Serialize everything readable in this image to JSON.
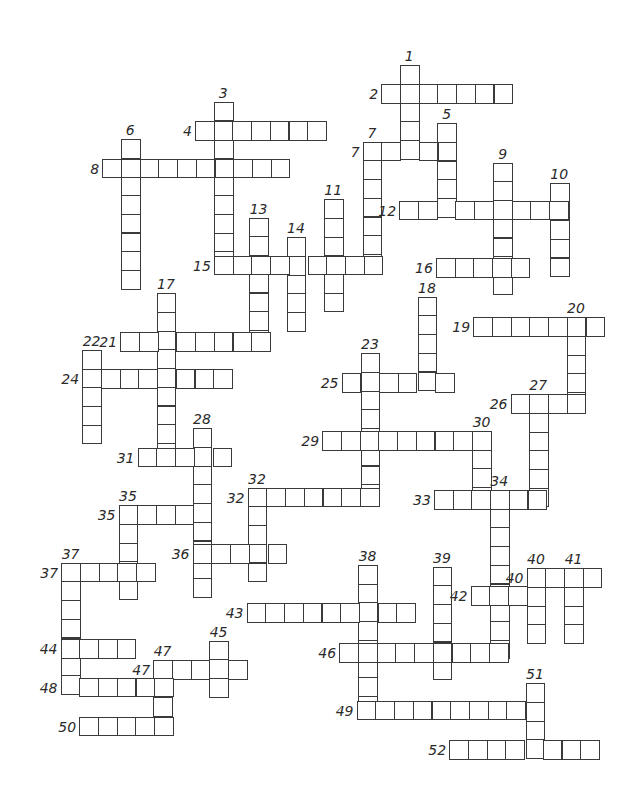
{
  "puzzle": {
    "type": "crossword",
    "cell_size": 18.7,
    "line_color": "#3a3a3a",
    "background": "#ffffff",
    "words": [
      {
        "num": "1",
        "dir": "down",
        "x": 400,
        "y": 65.3,
        "len": 5
      },
      {
        "num": "2",
        "dir": "across",
        "x": 381.3,
        "y": 84,
        "len": 7
      },
      {
        "num": "3",
        "dir": "down",
        "x": 214,
        "y": 101.7,
        "len": 9
      },
      {
        "num": "4",
        "dir": "across",
        "x": 195,
        "y": 121,
        "len": 7
      },
      {
        "num": "5",
        "dir": "down",
        "x": 437.3,
        "y": 123.3,
        "len": 5
      },
      {
        "num": "6",
        "dir": "down",
        "x": 121,
        "y": 139,
        "len": 8
      },
      {
        "num": "7",
        "dir": "across",
        "x": 362.7,
        "y": 141.7,
        "len": 5
      },
      {
        "num": "7",
        "dir": "down",
        "x": 362.7,
        "y": 141.7,
        "len": 7
      },
      {
        "num": "8",
        "dir": "across",
        "x": 102.3,
        "y": 158.7,
        "len": 10
      },
      {
        "num": "9",
        "dir": "down",
        "x": 493.3,
        "y": 162.7,
        "len": 7
      },
      {
        "num": "10",
        "dir": "down",
        "x": 550,
        "y": 182.7,
        "len": 5
      },
      {
        "num": "11",
        "dir": "down",
        "x": 324,
        "y": 199.3,
        "len": 6
      },
      {
        "num": "12",
        "dir": "across",
        "x": 399.3,
        "y": 200.7,
        "len": 9
      },
      {
        "num": "13",
        "dir": "down",
        "x": 249.3,
        "y": 217.7,
        "len": 7
      },
      {
        "num": "14",
        "dir": "down",
        "x": 286.7,
        "y": 237.3,
        "len": 5
      },
      {
        "num": "15",
        "dir": "across",
        "x": 214,
        "y": 255.7,
        "len": 9
      },
      {
        "num": "16",
        "dir": "across",
        "x": 436,
        "y": 258.3,
        "len": 5
      },
      {
        "num": "17",
        "dir": "down",
        "x": 156.7,
        "y": 293.3,
        "len": 9
      },
      {
        "num": "18",
        "dir": "down",
        "x": 417.7,
        "y": 296.7,
        "len": 5
      },
      {
        "num": "19",
        "dir": "across",
        "x": 473.3,
        "y": 317.3,
        "len": 7
      },
      {
        "num": "20",
        "dir": "down",
        "x": 566.7,
        "y": 317.3,
        "len": 5
      },
      {
        "num": "21",
        "dir": "across",
        "x": 120.3,
        "y": 332.3,
        "len": 8
      },
      {
        "num": "22",
        "dir": "down",
        "x": 82.3,
        "y": 350,
        "len": 5
      },
      {
        "num": "23",
        "dir": "down",
        "x": 360.7,
        "y": 353.3,
        "len": 8
      },
      {
        "num": "24",
        "dir": "across",
        "x": 82.3,
        "y": 369.3,
        "len": 8
      },
      {
        "num": "25",
        "dir": "across",
        "x": 341.7,
        "y": 373.3,
        "len": 6
      },
      {
        "num": "26",
        "dir": "across",
        "x": 510.7,
        "y": 394.3,
        "len": 4
      },
      {
        "num": "27",
        "dir": "down",
        "x": 529,
        "y": 394.3,
        "len": 6
      },
      {
        "num": "28",
        "dir": "down",
        "x": 192.7,
        "y": 428.3,
        "len": 9
      },
      {
        "num": "29",
        "dir": "across",
        "x": 322.3,
        "y": 431,
        "len": 9
      },
      {
        "num": "30",
        "dir": "down",
        "x": 472.3,
        "y": 431,
        "len": 4
      },
      {
        "num": "31",
        "dir": "across",
        "x": 137.7,
        "y": 447.7,
        "len": 5
      },
      {
        "num": "32",
        "dir": "across",
        "x": 247.7,
        "y": 487.7,
        "len": 7
      },
      {
        "num": "32",
        "dir": "down",
        "x": 247.7,
        "y": 487.7,
        "len": 5
      },
      {
        "num": "33",
        "dir": "across",
        "x": 434,
        "y": 490,
        "len": 6
      },
      {
        "num": "34",
        "dir": "down",
        "x": 490,
        "y": 490,
        "len": 9
      },
      {
        "num": "35",
        "dir": "across",
        "x": 118.7,
        "y": 505.3,
        "len": 5
      },
      {
        "num": "35",
        "dir": "down",
        "x": 118.7,
        "y": 505.3,
        "len": 5
      },
      {
        "num": "36",
        "dir": "across",
        "x": 192.7,
        "y": 544.3,
        "len": 5
      },
      {
        "num": "37",
        "dir": "across",
        "x": 61.3,
        "y": 562.7,
        "len": 5
      },
      {
        "num": "37",
        "dir": "down",
        "x": 61.3,
        "y": 562.7,
        "len": 7
      },
      {
        "num": "38",
        "dir": "down",
        "x": 358.3,
        "y": 565,
        "len": 8
      },
      {
        "num": "39",
        "dir": "down",
        "x": 432.7,
        "y": 566.7,
        "len": 6
      },
      {
        "num": "40",
        "dir": "across",
        "x": 526.7,
        "y": 568.3,
        "len": 4
      },
      {
        "num": "40",
        "dir": "down",
        "x": 526.7,
        "y": 568.3,
        "len": 4
      },
      {
        "num": "41",
        "dir": "down",
        "x": 564.3,
        "y": 568.3,
        "len": 4
      },
      {
        "num": "42",
        "dir": "across",
        "x": 470.7,
        "y": 586,
        "len": 4
      },
      {
        "num": "43",
        "dir": "across",
        "x": 246.7,
        "y": 603.3,
        "len": 9
      },
      {
        "num": "44",
        "dir": "across",
        "x": 60.7,
        "y": 639.3,
        "len": 4
      },
      {
        "num": "45",
        "dir": "down",
        "x": 209.3,
        "y": 640.7,
        "len": 3
      },
      {
        "num": "46",
        "dir": "across",
        "x": 339.3,
        "y": 643.3,
        "len": 9
      },
      {
        "num": "47",
        "dir": "across",
        "x": 153.3,
        "y": 660,
        "len": 5
      },
      {
        "num": "47",
        "dir": "down",
        "x": 153.3,
        "y": 660,
        "len": 4
      },
      {
        "num": "48",
        "dir": "across",
        "x": 60.7,
        "y": 677.7,
        "len": 6
      },
      {
        "num": "49",
        "dir": "across",
        "x": 356.7,
        "y": 700.7,
        "len": 10
      },
      {
        "num": "50",
        "dir": "across",
        "x": 79.3,
        "y": 716.7,
        "len": 5
      },
      {
        "num": "51",
        "dir": "down",
        "x": 525.7,
        "y": 683.3,
        "len": 4
      },
      {
        "num": "52",
        "dir": "across",
        "x": 449.3,
        "y": 740,
        "len": 8
      }
    ]
  }
}
